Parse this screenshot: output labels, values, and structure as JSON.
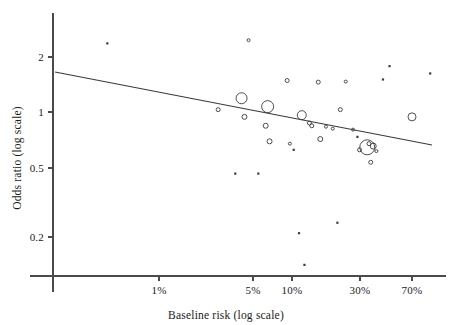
{
  "chart_data": {
    "type": "scatter",
    "title": "",
    "xlabel": "Baseline risk (log scale)",
    "ylabel": "Odds ratio (log scale)",
    "x_scale": "log",
    "y_scale": "log",
    "grid": false,
    "legend": "none",
    "xticks": [
      {
        "label": "1%",
        "value": 1,
        "px": 159
      },
      {
        "label": "5%",
        "value": 5,
        "px": 253
      },
      {
        "label": "10%",
        "value": 10,
        "px": 292
      },
      {
        "label": "30%",
        "value": 30,
        "px": 360
      },
      {
        "label": "70%",
        "value": 70,
        "px": 412
      }
    ],
    "yticks": [
      {
        "label": "2",
        "value": 2,
        "px": 57
      },
      {
        "label": "1",
        "value": 1,
        "px": 112
      },
      {
        "label": "0.5",
        "value": 0.5,
        "px": 168
      },
      {
        "label": "0.2",
        "value": 0.2,
        "px": 237
      }
    ],
    "xlim": [
      0.35,
      110
    ],
    "ylim": [
      0.12,
      3.1
    ],
    "marker_encoding": "bubble area proportional to study weight",
    "regression_line": {
      "label": "meta-regression fit",
      "x_start_px": 55,
      "y_start_px": 72,
      "x_end_px": 432,
      "y_end_px": 145,
      "y_at_left": 1.72,
      "y_at_right": 0.77
    },
    "points": [
      {
        "x": 0.42,
        "y": 2.38,
        "size": 2
      },
      {
        "x": 2.7,
        "y": 1.02,
        "size": 4
      },
      {
        "x": 3.6,
        "y": 0.45,
        "size": 2
      },
      {
        "x": 4.0,
        "y": 1.18,
        "size": 11
      },
      {
        "x": 4.2,
        "y": 0.93,
        "size": 5
      },
      {
        "x": 4.5,
        "y": 2.48,
        "size": 3
      },
      {
        "x": 5.3,
        "y": 0.45,
        "size": 2
      },
      {
        "x": 6.2,
        "y": 1.06,
        "size": 12
      },
      {
        "x": 6.0,
        "y": 0.83,
        "size": 5
      },
      {
        "x": 6.4,
        "y": 0.68,
        "size": 5
      },
      {
        "x": 8.6,
        "y": 1.48,
        "size": 4
      },
      {
        "x": 9.0,
        "y": 0.66,
        "size": 3
      },
      {
        "x": 9.6,
        "y": 0.61,
        "size": 2
      },
      {
        "x": 10.5,
        "y": 0.21,
        "size": 2
      },
      {
        "x": 11.0,
        "y": 0.95,
        "size": 9
      },
      {
        "x": 11.5,
        "y": 0.14,
        "size": 2
      },
      {
        "x": 12.5,
        "y": 0.86,
        "size": 4
      },
      {
        "x": 13.0,
        "y": 0.83,
        "size": 4
      },
      {
        "x": 14.5,
        "y": 1.45,
        "size": 4
      },
      {
        "x": 15.0,
        "y": 0.7,
        "size": 5
      },
      {
        "x": 16.5,
        "y": 0.82,
        "size": 3
      },
      {
        "x": 18.5,
        "y": 0.8,
        "size": 3
      },
      {
        "x": 20.0,
        "y": 0.24,
        "size": 2
      },
      {
        "x": 21.0,
        "y": 1.02,
        "size": 4
      },
      {
        "x": 23.0,
        "y": 1.46,
        "size": 3
      },
      {
        "x": 26.0,
        "y": 0.79,
        "size": 3
      },
      {
        "x": 28.0,
        "y": 0.72,
        "size": 2
      },
      {
        "x": 29.0,
        "y": 0.61,
        "size": 4
      },
      {
        "x": 33.0,
        "y": 0.63,
        "size": 15
      },
      {
        "x": 34.0,
        "y": 0.66,
        "size": 4
      },
      {
        "x": 36.5,
        "y": 0.64,
        "size": 6
      },
      {
        "x": 35.0,
        "y": 0.52,
        "size": 4
      },
      {
        "x": 38.5,
        "y": 0.6,
        "size": 3
      },
      {
        "x": 43.0,
        "y": 1.5,
        "size": 2
      },
      {
        "x": 48.0,
        "y": 1.78,
        "size": 2
      },
      {
        "x": 70.0,
        "y": 0.93,
        "size": 8
      },
      {
        "x": 95.0,
        "y": 1.62,
        "size": 2
      }
    ]
  },
  "axes": {
    "x_axis_y_px": 276,
    "y_axis_x_px": 53,
    "x_axis_start_px": 30,
    "x_axis_end_px": 446,
    "y_axis_start_px": 13,
    "y_axis_end_px": 292
  }
}
